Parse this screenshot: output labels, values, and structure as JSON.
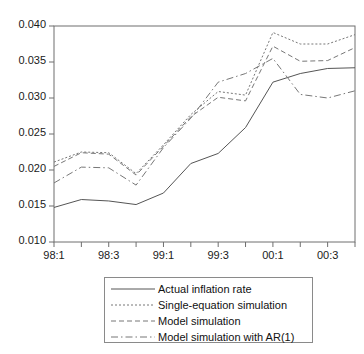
{
  "chart_data": {
    "type": "line",
    "title": "",
    "xlabel": "",
    "ylabel": "",
    "ylim": [
      0.01,
      0.04
    ],
    "ytick_labels": [
      "0.040",
      "0.035",
      "0.030",
      "0.025",
      "0.020",
      "0.015",
      "0.010"
    ],
    "ytick_values": [
      0.04,
      0.035,
      0.03,
      0.025,
      0.02,
      0.015,
      0.01
    ],
    "x": [
      "98:1",
      "98:2",
      "98:3",
      "98:4",
      "99:1",
      "99:2",
      "99:3",
      "99:4",
      "00:1",
      "00:2",
      "00:3",
      "00:4"
    ],
    "xtick_labels": [
      "98:1",
      "98:3",
      "99:1",
      "99:3",
      "00:1",
      "00:3"
    ],
    "xtick_indices": [
      0,
      2,
      4,
      6,
      8,
      10
    ],
    "grid": false,
    "legend_position": "below-center",
    "series": [
      {
        "name": "Actual inflation rate",
        "style": "solid",
        "color": "#555555",
        "values": [
          0.0148,
          0.0159,
          0.0157,
          0.0152,
          0.0168,
          0.0209,
          0.0223,
          0.0259,
          0.0322,
          0.0334,
          0.0341,
          0.0342
        ]
      },
      {
        "name": "Single-equation simulation",
        "style": "dotted",
        "color": "#777777",
        "values": [
          0.0211,
          0.0225,
          0.0224,
          0.0195,
          0.0235,
          0.0277,
          0.0309,
          0.0304,
          0.0391,
          0.0375,
          0.0375,
          0.0388
        ]
      },
      {
        "name": "Model simulation",
        "style": "dashed",
        "color": "#777777",
        "values": [
          0.0205,
          0.0224,
          0.0222,
          0.0193,
          0.0233,
          0.0274,
          0.0301,
          0.0296,
          0.0372,
          0.0351,
          0.0352,
          0.037
        ]
      },
      {
        "name": "Model simulation with AR(1)",
        "style": "dashdot",
        "color": "#777777",
        "values": [
          0.0182,
          0.0204,
          0.0203,
          0.0179,
          0.0231,
          0.0272,
          0.0322,
          0.0334,
          0.0355,
          0.0305,
          0.03,
          0.031
        ]
      }
    ]
  },
  "legend": {
    "items": [
      {
        "label": "Actual inflation rate"
      },
      {
        "label": "Single-equation simulation"
      },
      {
        "label": "Model simulation"
      },
      {
        "label": "Model simulation with AR(1)"
      }
    ]
  }
}
